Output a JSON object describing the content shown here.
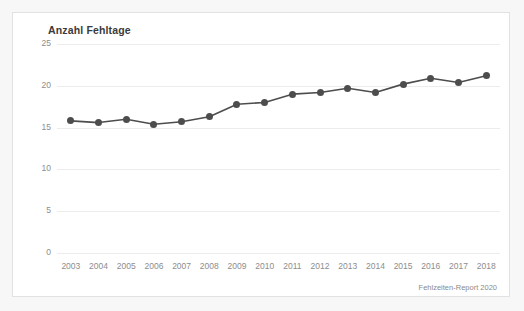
{
  "card": {
    "title": "Anzahl Fehltage",
    "source_note": "Fehlzeiten-Report 2020",
    "background_color": "#ffffff",
    "border_color": "#e2e2e2",
    "page_background_color": "#f7f7f7"
  },
  "chart_data": {
    "type": "line",
    "title": "Anzahl Fehltage",
    "xlabel": "",
    "ylabel": "",
    "categories": [
      "2003",
      "2004",
      "2005",
      "2006",
      "2007",
      "2008",
      "2009",
      "2010",
      "2011",
      "2012",
      "2013",
      "2014",
      "2015",
      "2016",
      "2017",
      "2018"
    ],
    "values": [
      15.8,
      15.6,
      16.0,
      15.4,
      15.7,
      16.3,
      17.8,
      18.0,
      19.0,
      19.2,
      19.7,
      19.2,
      20.2,
      20.9,
      20.4,
      21.2
    ],
    "series": [
      {
        "name": "Anzahl Fehltage",
        "values": [
          15.8,
          15.6,
          16.0,
          15.4,
          15.7,
          16.3,
          17.8,
          18.0,
          19.0,
          19.2,
          19.7,
          19.2,
          20.2,
          20.9,
          20.4,
          21.2
        ],
        "line_color": "#4d4d4d",
        "marker_color": "#4d4d4d"
      }
    ],
    "ylim": [
      0,
      25
    ],
    "yticks": [
      0,
      5,
      10,
      15,
      20,
      25
    ],
    "ytick_labels": [
      "0",
      "5",
      "10",
      "15",
      "20",
      "25"
    ],
    "xtick_labels": [
      "2003",
      "2004",
      "2005",
      "2006",
      "2007",
      "2008",
      "2009",
      "2010",
      "2011",
      "2012",
      "2013",
      "2014",
      "2015",
      "2016",
      "2017",
      "2018"
    ],
    "grid": true,
    "grid_color": "#ececec",
    "legend": false,
    "legend_position": "none",
    "annotations": [
      "Fehlzeiten-Report 2020"
    ]
  }
}
